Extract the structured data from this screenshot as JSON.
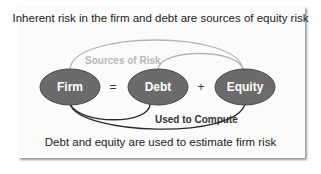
{
  "diagram": {
    "title": "Inherent risk in the firm and debt are sources of equity risk",
    "footer": "Debt and equity are used to estimate firm risk",
    "nodes": [
      {
        "id": "firm",
        "label": "Firm"
      },
      {
        "id": "debt",
        "label": "Debt"
      },
      {
        "id": "equity",
        "label": "Equity"
      }
    ],
    "operators": {
      "equals": "=",
      "plus": "+"
    },
    "arcs": {
      "top_label": "Sources of Risk",
      "bottom_label": "Used to Compute"
    },
    "colors": {
      "node_fill": "#6b6b6b",
      "node_stroke": "#4a4a4a",
      "top_arc": "#b5b5b5",
      "bottom_arc": "#2a2a2a",
      "card_background": "#fbfbfb"
    }
  }
}
